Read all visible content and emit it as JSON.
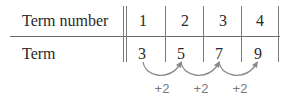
{
  "table": {
    "row_headers": {
      "term_number": "Term number",
      "term": "Term"
    },
    "term_numbers": [
      "1",
      "2",
      "3",
      "4"
    ],
    "terms": [
      "3",
      "5",
      "7",
      "9"
    ],
    "differences": [
      "+2",
      "+2",
      "+2"
    ]
  },
  "colors": {
    "text": "#2a2a2a",
    "lines": "#6b6b6b",
    "arrows": "#8a8a8a",
    "difference_labels": "#7a7a7a"
  }
}
